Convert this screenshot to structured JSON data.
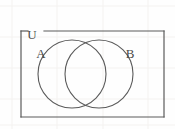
{
  "figure": {
    "type": "venn-diagram",
    "background_color": "#fefefe",
    "stroke_color": "#5a5a5a",
    "grid_color": "#f4f2f0",
    "label_color": "#4a4a4a"
  },
  "universe": {
    "label": "U",
    "shape": "rectangle",
    "x": 21,
    "y": 31,
    "width": 143,
    "height": 86,
    "label_x": 32,
    "label_y": 36,
    "gap_start_x": 28,
    "gap_end_x": 44
  },
  "sets": [
    {
      "label": "A",
      "shape": "circle",
      "cx": 72,
      "cy": 74,
      "r": 34,
      "label_x": 41,
      "label_y": 55
    },
    {
      "label": "B",
      "shape": "circle",
      "cx": 99,
      "cy": 74,
      "r": 34,
      "label_x": 130,
      "label_y": 55
    }
  ],
  "grid": {
    "vertical_x": [
      12,
      57,
      103,
      148
    ],
    "horizontal_y": [
      6,
      37,
      68,
      99,
      125
    ]
  }
}
